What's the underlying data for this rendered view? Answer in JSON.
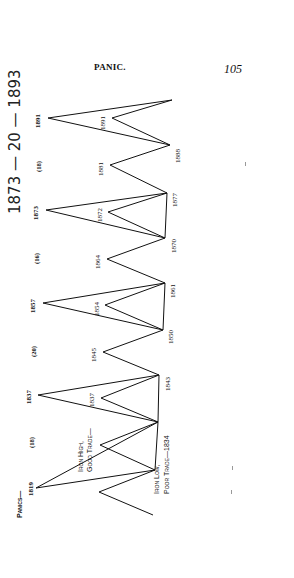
{
  "page": {
    "running_head": "PANIC.",
    "page_number": "105",
    "handwritten_note": "1873 — 20 — 1893"
  },
  "chart_data": {
    "type": "line",
    "orientation": "rotated, time runs bottom to top",
    "series": [
      {
        "name": "Panics (outer peaks)",
        "years": [
          "1819",
          "1837",
          "1857",
          "1873",
          "1891"
        ],
        "labels": [
          "Panics—1819",
          "1837",
          "1857",
          "1873",
          "1891"
        ]
      },
      {
        "name": "Iron high, good trade (inner peaks)",
        "years": [
          "",
          "Iron High, Good Trade—",
          "1837",
          "1845",
          "1854",
          "1864",
          "1872",
          "1881",
          "1891"
        ]
      },
      {
        "name": "Iron low, poor trade (troughs)",
        "years": [
          "",
          "Iron Low,",
          "1834",
          "1843",
          "1850",
          "1861",
          "1870",
          "1877",
          "1888",
          ""
        ]
      }
    ],
    "intervals": [
      "(18)",
      "(20)",
      "(16)",
      "(18)"
    ],
    "annotations": {
      "panics": "Panics—",
      "iron_high": "Iron High,",
      "good_trade": "Good Trade—",
      "iron_low": "Iron Low,",
      "poor_trade": "Poor Trade—1834"
    }
  }
}
